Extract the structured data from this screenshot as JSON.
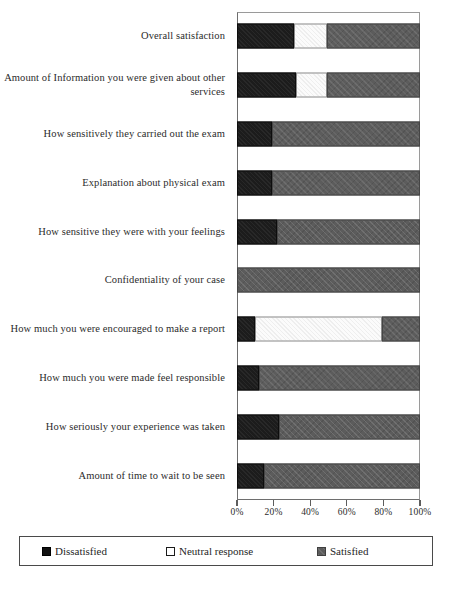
{
  "chart_data": {
    "type": "bar",
    "orientation": "horizontal",
    "stacked": true,
    "stacked_100pct": true,
    "title": "",
    "subtitle": "",
    "xlabel": "",
    "ylabel": "",
    "xlim": [
      0,
      100
    ],
    "xticks": [
      0,
      20,
      40,
      60,
      80,
      100
    ],
    "xticklabels": [
      "0%",
      "20%",
      "40%",
      "60%",
      "80%",
      "100%"
    ],
    "grid": false,
    "legend_position": "bottom",
    "categories": [
      "Overall satisfaction",
      "Amount of Information you were given about other services",
      "How sensitively they carried out the exam",
      "Explanation about physical exam",
      "How sensitive they were with your feelings",
      "Confidentiality of your case",
      "How much you were encouraged to make a report",
      "How much you were made feel responsible",
      "How seriously your experience was taken",
      "Amount of time to wait to be seen"
    ],
    "series": [
      {
        "name": "Dissatisfied",
        "color": "#1c1c1c",
        "values": [
          31,
          32,
          19,
          19,
          22,
          0,
          10,
          12,
          23,
          15
        ]
      },
      {
        "name": "Neutral response",
        "color": "#ffffff",
        "values": [
          18,
          17,
          0,
          0,
          0,
          0,
          69,
          0,
          0,
          0
        ]
      },
      {
        "name": "Satisfied",
        "color": "#5c5c5c",
        "values": [
          51,
          51,
          81,
          81,
          78,
          100,
          21,
          88,
          77,
          85
        ]
      }
    ]
  },
  "legend": {
    "items": [
      {
        "label": "Dissatisfied",
        "swatch": "filled-black-square"
      },
      {
        "label": "Neutral response",
        "swatch": "outlined-white-square"
      },
      {
        "label": "Satisfied",
        "swatch": "filled-gray-square"
      }
    ]
  }
}
